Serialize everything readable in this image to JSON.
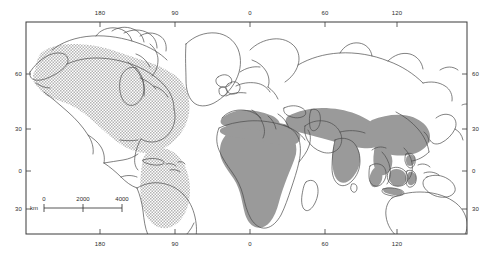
{
  "figure": {
    "type": "world-distribution-map",
    "projection": "rectangular lat/lon grid"
  },
  "axes": {
    "top": {
      "label_name": "longitude-axis-top",
      "ticks": [
        {
          "value": "180",
          "x": 100
        },
        {
          "value": "90",
          "x": 175
        },
        {
          "value": "0",
          "x": 250
        },
        {
          "value": "60",
          "x": 325
        },
        {
          "value": "120",
          "x": 397
        }
      ]
    },
    "bottom": {
      "label_name": "longitude-axis-bottom",
      "ticks": [
        {
          "value": "180",
          "x": 100
        },
        {
          "value": "90",
          "x": 175
        },
        {
          "value": "0",
          "x": 250
        },
        {
          "value": "60",
          "x": 325
        },
        {
          "value": "120",
          "x": 397
        }
      ]
    },
    "left": {
      "label_name": "latitude-axis-left",
      "ticks": [
        {
          "value": "60",
          "y": 74
        },
        {
          "value": "30",
          "y": 129
        },
        {
          "value": "0",
          "y": 171
        },
        {
          "value": "30",
          "y": 209
        }
      ]
    },
    "right": {
      "label_name": "latitude-axis-right",
      "ticks": [
        {
          "value": "60",
          "y": 74
        },
        {
          "value": "30",
          "y": 129
        },
        {
          "value": "0",
          "y": 171
        },
        {
          "value": "30",
          "y": 209
        }
      ]
    }
  },
  "scalebar": {
    "unit": "km",
    "ticks": [
      "0",
      "2000",
      "4000"
    ],
    "tick_positions": [
      0,
      39,
      78
    ]
  },
  "legend": {
    "stipple_region_name": "new-world-range",
    "solid_region_name": "old-world-range"
  },
  "colors": {
    "frame": "#3a3a3a",
    "coastline": "#4a4a4a",
    "solid_fill": "#9a9a9a",
    "stipple_fill": "#c9c9c9",
    "text": "#2b2b2b",
    "background": "#ffffff"
  }
}
